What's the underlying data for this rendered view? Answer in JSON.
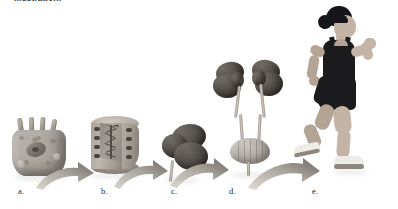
{
  "figure": {
    "caption_top": "Illustration.",
    "alt_description": "Levels of biological organization shown left to right: cell, tissue, organ (kidney), organ system (urinary system), and organism (running woman), connected by curved arrows.",
    "background_color": "#ffffff",
    "ink_color": "#1d1d1d",
    "arrow_color": "#9b968f"
  },
  "panels": [
    {
      "id": "cell",
      "label": "a.",
      "name": "cell-illustration",
      "level": "Cell",
      "x": 22,
      "y": 192
    },
    {
      "id": "tissue",
      "label": "b.",
      "name": "tissue-block-illustration",
      "level": "Tissue",
      "x": 105,
      "y": 192
    },
    {
      "id": "kidney",
      "label": "c.",
      "name": "kidney-organ-illustration",
      "level": "Organ",
      "x": 175,
      "y": 192
    },
    {
      "id": "urinary-system",
      "label": "d.",
      "name": "urinary-system-illustration",
      "level": "Organ system",
      "x": 233,
      "y": 192
    },
    {
      "id": "organism",
      "label": "e.",
      "name": "runner-organism-illustration",
      "level": "Organism",
      "x": 316,
      "y": 192
    }
  ],
  "arrows": [
    {
      "name": "arrow-cell-to-tissue",
      "from": "a.",
      "to": "b."
    },
    {
      "name": "arrow-tissue-to-kidney",
      "from": "b.",
      "to": "c."
    },
    {
      "name": "arrow-kidney-to-system",
      "from": "c.",
      "to": "d."
    },
    {
      "name": "arrow-system-to-organism",
      "from": "d.",
      "to": "e."
    }
  ]
}
